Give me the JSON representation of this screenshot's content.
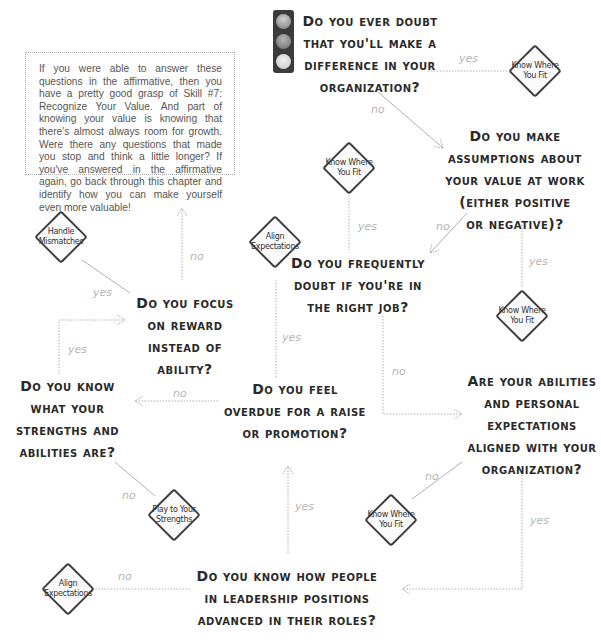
{
  "note": {
    "text": "If you were able to answer these questions in the affirmative, then you have a pretty good grasp of Skill #7: Recognize Your Value. And part of knowing your value is knowing that there's almost always room for growth. Were there any questions that made you stop and think a little longer? If you've answered in the affirmative again, go back through this chapter and identify how you can make yourself even more valuable!"
  },
  "questions": {
    "q1": [
      "Do you ever doubt",
      "that you'll make a",
      "difference in your",
      "organization?"
    ],
    "q2": [
      "Do you make",
      "assumptions about",
      "your value at work",
      "(either positive",
      "or negative)?"
    ],
    "q3": [
      "Do you frequently",
      "doubt if you're in",
      "the right job?"
    ],
    "q4": [
      "Are your abilities",
      "and personal",
      "expectations",
      "aligned with your",
      "organization?"
    ],
    "q5": [
      "Do you know how people",
      "in leadership positions",
      "advanced in their roles?"
    ],
    "q6": [
      "Do you feel",
      "overdue for a raise",
      "or promotion?"
    ],
    "q7": [
      "Do you know",
      "what your",
      "strengths and",
      "abilities are?"
    ],
    "q8": [
      "Do you focus",
      "on reward",
      "instead of",
      "ability?"
    ]
  },
  "diamonds": {
    "d1": [
      "Know Where",
      "You Fit"
    ],
    "d2": [
      "Know Where",
      "You Fit"
    ],
    "d3": [
      "Know Where",
      "You Fit"
    ],
    "d4": [
      "Know Where",
      "You Fit"
    ],
    "d5": [
      "Align",
      "Expectations"
    ],
    "d6": [
      "Play to Your",
      "Strengths"
    ],
    "d7": [
      "Align",
      "Expectations"
    ],
    "d8": [
      "Handle",
      "Mismatches"
    ]
  },
  "labels": {
    "yes": "yes",
    "no": "no"
  },
  "colors": {
    "question_text": "#2a2a2a",
    "diamond_border": "#3f3f3f",
    "connector": "#b0b0b0",
    "label": "#b5b5b5",
    "traffic_light": "#3b3b3b"
  }
}
